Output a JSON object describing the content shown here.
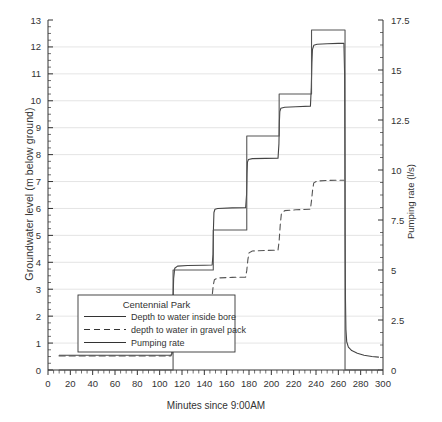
{
  "chart_data": {
    "type": "line",
    "title": "",
    "xlabel": "Minutes since 9:00AM",
    "ylabel": "Groundwater level (m below ground)",
    "y2label": "Pumping rate (l/s)",
    "xlim": [
      0,
      300
    ],
    "ylim": [
      13,
      0
    ],
    "y2lim": [
      0,
      17.5
    ],
    "y_inverted": true,
    "grid": true,
    "grid_axis": "y",
    "legend_position": "lower-left",
    "legend_title": "Centennial Park",
    "xticks": [
      0,
      20,
      40,
      60,
      80,
      100,
      120,
      140,
      160,
      180,
      200,
      220,
      240,
      260,
      280,
      300
    ],
    "xtick_labels": [
      "0",
      "20",
      "40",
      "60",
      "80",
      "100",
      "120",
      "140",
      "160",
      "180",
      "200",
      "220",
      "240",
      "260",
      "280",
      "300"
    ],
    "x_minor_tick_step": 5,
    "yticks": [
      0,
      1,
      2,
      3,
      4,
      5,
      6,
      7,
      8,
      9,
      10,
      11,
      12,
      13
    ],
    "ytick_labels": [
      "0",
      "1",
      "2",
      "3",
      "4",
      "5",
      "6",
      "7",
      "8",
      "9",
      "10",
      "11",
      "12",
      "13"
    ],
    "y_minor_tick_step": 0.25,
    "y2ticks": [
      0,
      2.5,
      5,
      7.5,
      10,
      12.5,
      15,
      17.5
    ],
    "y2tick_labels": [
      "0",
      "2.5",
      "5",
      "7.5",
      "10",
      "12.5",
      "15",
      "17.5"
    ],
    "y2_minor_tick_step": 0.625,
    "series": [
      {
        "name": "Depth to water inside bore",
        "style": "solid",
        "axis": "left",
        "color": "#444444",
        "points": [
          [
            10,
            0.55
          ],
          [
            60,
            0.55
          ],
          [
            100,
            0.55
          ],
          [
            110,
            0.55
          ],
          [
            111,
            0.6
          ],
          [
            111.5,
            1.6
          ],
          [
            112,
            2.6
          ],
          [
            112.5,
            3.4
          ],
          [
            113.5,
            3.78
          ],
          [
            116,
            3.86
          ],
          [
            125,
            3.88
          ],
          [
            140,
            3.89
          ],
          [
            147,
            3.9
          ],
          [
            147.8,
            4.3
          ],
          [
            148.2,
            5.3
          ],
          [
            148.6,
            5.85
          ],
          [
            149.5,
            5.97
          ],
          [
            152,
            6.0
          ],
          [
            165,
            6.02
          ],
          [
            177,
            6.03
          ],
          [
            177.8,
            6.5
          ],
          [
            178.2,
            7.3
          ],
          [
            178.6,
            7.72
          ],
          [
            179.5,
            7.82
          ],
          [
            183,
            7.85
          ],
          [
            195,
            7.86
          ],
          [
            206,
            7.87
          ],
          [
            206.8,
            8.4
          ],
          [
            207.2,
            9.2
          ],
          [
            207.6,
            9.6
          ],
          [
            208.5,
            9.72
          ],
          [
            212,
            9.76
          ],
          [
            222,
            9.78
          ],
          [
            235,
            9.8
          ],
          [
            235.8,
            10.5
          ],
          [
            236.3,
            11.4
          ],
          [
            236.8,
            11.9
          ],
          [
            238,
            12.06
          ],
          [
            241,
            12.1
          ],
          [
            250,
            12.12
          ],
          [
            260,
            12.13
          ],
          [
            265,
            12.13
          ],
          [
            265.6,
            11.0
          ],
          [
            265.9,
            8.0
          ],
          [
            266.1,
            5.0
          ],
          [
            266.4,
            2.6
          ],
          [
            266.8,
            1.5
          ],
          [
            267.5,
            1.05
          ],
          [
            269,
            0.85
          ],
          [
            272,
            0.72
          ],
          [
            277,
            0.62
          ],
          [
            283,
            0.55
          ],
          [
            290,
            0.5
          ],
          [
            296,
            0.48
          ]
        ]
      },
      {
        "name": "depth to water in gravel pack",
        "style": "dashed",
        "axis": "left",
        "color": "#555555",
        "points": [
          [
            10,
            0.52
          ],
          [
            60,
            0.52
          ],
          [
            100,
            0.52
          ],
          [
            110,
            0.52
          ],
          [
            111,
            0.6
          ],
          [
            111.5,
            1.4
          ],
          [
            112,
            2.1
          ],
          [
            112.6,
            2.45
          ],
          [
            114,
            2.52
          ],
          [
            120,
            2.53
          ],
          [
            135,
            2.54
          ],
          [
            146,
            2.55
          ],
          [
            147,
            2.75
          ],
          [
            148,
            3.15
          ],
          [
            149,
            3.35
          ],
          [
            152,
            3.42
          ],
          [
            165,
            3.44
          ],
          [
            177,
            3.45
          ],
          [
            178,
            3.7
          ],
          [
            179,
            4.1
          ],
          [
            180,
            4.35
          ],
          [
            183,
            4.42
          ],
          [
            195,
            4.44
          ],
          [
            206,
            4.45
          ],
          [
            207,
            4.8
          ],
          [
            208,
            5.4
          ],
          [
            209,
            5.8
          ],
          [
            212,
            5.92
          ],
          [
            222,
            5.95
          ],
          [
            235,
            5.97
          ],
          [
            236,
            6.3
          ],
          [
            237,
            6.7
          ],
          [
            238,
            6.95
          ],
          [
            241,
            7.02
          ],
          [
            250,
            7.04
          ],
          [
            260,
            7.05
          ],
          [
            265,
            7.05
          ]
        ]
      },
      {
        "name": "Pumping rate",
        "style": "solid",
        "axis": "right",
        "color": "#555555",
        "points": [
          [
            10,
            0
          ],
          [
            112,
            0
          ],
          [
            112,
            5.0
          ],
          [
            148,
            5.0
          ],
          [
            148,
            7.0
          ],
          [
            178,
            7.0
          ],
          [
            178,
            11.7
          ],
          [
            207,
            11.7
          ],
          [
            207,
            13.8
          ],
          [
            236,
            13.8
          ],
          [
            236,
            17.0
          ],
          [
            266,
            17.0
          ],
          [
            266,
            0
          ],
          [
            296,
            0
          ]
        ]
      }
    ],
    "step_schedule": [
      {
        "start_min": 112,
        "end_min": 148,
        "rate_ls": 5.0
      },
      {
        "start_min": 148,
        "end_min": 178,
        "rate_ls": 7.0
      },
      {
        "start_min": 178,
        "end_min": 207,
        "rate_ls": 11.7
      },
      {
        "start_min": 207,
        "end_min": 236,
        "rate_ls": 13.8
      },
      {
        "start_min": 236,
        "end_min": 266,
        "rate_ls": 17.0
      }
    ],
    "legend_entries": [
      {
        "label": "Depth to water inside bore",
        "style": "solid"
      },
      {
        "label": "depth to water in gravel pack",
        "style": "dashed"
      },
      {
        "label": "Pumping rate",
        "style": "solid"
      }
    ]
  },
  "colors": {
    "axis": "#333333",
    "grid": "#d8d8d8",
    "bore_line": "#444444",
    "gravel_line": "#555555",
    "rate_line": "#555555",
    "background": "#ffffff"
  }
}
